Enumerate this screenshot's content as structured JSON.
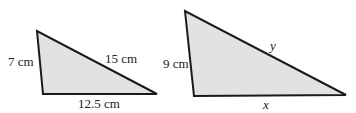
{
  "diagram": {
    "type": "similar-triangles",
    "fill_color": "#e2e2e2",
    "stroke_color": "#1a1a1a",
    "triangles": [
      {
        "id": "triangle-1",
        "vertices": [
          [
            37,
            31
          ],
          [
            43,
            94
          ],
          [
            157,
            94
          ]
        ],
        "labels": {
          "left_side": "7 cm",
          "hypotenuse": "15 cm",
          "base": "12.5 cm"
        }
      },
      {
        "id": "triangle-2",
        "vertices": [
          [
            185,
            11
          ],
          [
            194,
            96
          ],
          [
            346,
            95
          ]
        ],
        "labels": {
          "left_side": "9 cm",
          "hypotenuse": "y",
          "base": "x"
        }
      }
    ]
  }
}
